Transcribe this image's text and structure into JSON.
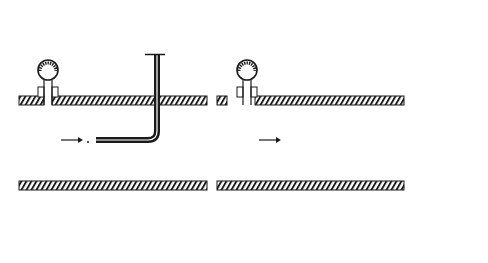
{
  "figure": {
    "panels": [
      {
        "id": "a",
        "caption": "(a) Stagnation-Type",
        "labels": {
          "stagnation_pressure": "p",
          "stagnation_pressure_sub": "0",
          "static_pressure": "p",
          "static_pressure_sub": "s",
          "velocity": "V"
        }
      },
      {
        "id": "b",
        "caption": "(b) Prandtl-Type",
        "labels": {
          "stagnation_pressure": "p",
          "stagnation_pressure_sub": "0",
          "static_pressure": "p",
          "static_pressure_sub": "s",
          "velocity": "V",
          "manometer": "Manometer",
          "glass": "Glass",
          "mercury": "Mercury"
        }
      }
    ],
    "colors": {
      "ink": "#1a1a1a",
      "mercury": "#9a9a9a",
      "background": "#ffffff"
    }
  }
}
